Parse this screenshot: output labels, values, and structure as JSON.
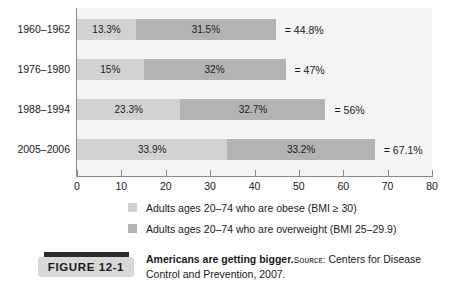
{
  "chart_data": {
    "type": "bar",
    "orientation": "horizontal",
    "stacked": true,
    "title": "Americans are getting bigger.",
    "xlabel": "",
    "ylabel": "",
    "xlim": [
      0,
      80
    ],
    "xticks": [
      0,
      10,
      20,
      30,
      40,
      50,
      60,
      70,
      80
    ],
    "grid": false,
    "legend_position": "bottom",
    "categories": [
      "1960–1962",
      "1976–1980",
      "1988–1994",
      "2005–2006"
    ],
    "series": [
      {
        "name": "Adults ages 20–74 who are obese (BMI ≥ 30)",
        "key": "obese",
        "color": "#d2d2d2",
        "values": [
          13.3,
          15,
          23.3,
          33.9
        ],
        "labels": [
          "13.3%",
          "15%",
          "23.3%",
          "33.9%"
        ]
      },
      {
        "name": "Adults ages 20–74 who are overweight (BMI 25–29.9)",
        "key": "overweight",
        "color": "#b3b3b3",
        "values": [
          31.5,
          32,
          32.7,
          33.2
        ],
        "labels": [
          "31.5%",
          "32%",
          "32.7%",
          "33.2%"
        ]
      }
    ],
    "totals": [
      44.8,
      47,
      56,
      67.1
    ],
    "total_labels": [
      "= 44.8%",
      "= 47%",
      "= 56%",
      "= 67.1%"
    ]
  },
  "rows": [
    {
      "category": "1960–1962",
      "obese_value": 13.3,
      "obese_label": "13.3%",
      "overweight_value": 31.5,
      "overweight_label": "31.5%",
      "total_label": "= 44.8%"
    },
    {
      "category": "1976–1980",
      "obese_value": 15,
      "obese_label": "15%",
      "overweight_value": 32,
      "overweight_label": "32%",
      "total_label": "= 47%"
    },
    {
      "category": "1988–1994",
      "obese_value": 23.3,
      "obese_label": "23.3%",
      "overweight_value": 32.7,
      "overweight_label": "32.7%",
      "total_label": "= 56%"
    },
    {
      "category": "2005–2006",
      "obese_value": 33.9,
      "obese_label": "33.9%",
      "overweight_value": 33.2,
      "overweight_label": "33.2%",
      "total_label": "= 67.1%"
    }
  ],
  "axis": {
    "ticks": [
      "0",
      "10",
      "20",
      "30",
      "40",
      "50",
      "60",
      "70",
      "80"
    ]
  },
  "legend": {
    "items": [
      {
        "label": "Adults ages 20–74 who are obese (BMI ≥ 30)",
        "color": "#d2d2d2"
      },
      {
        "label": "Adults ages 20–74 who are overweight (BMI 25–29.9)",
        "color": "#b3b3b3"
      }
    ]
  },
  "figure": {
    "tag": "FIGURE  12-1",
    "caption_title": "Americans are getting bigger.",
    "source_label": "Sᴏᴜʀᴄᴇ:",
    "source_text": " Centers for Disease Control and Prevention, 2007."
  },
  "colors": {
    "obese": "#d2d2d2",
    "overweight": "#b3b3b3",
    "plot_background": "#f4f4f4",
    "axis": "#8a8a8a",
    "text": "#1a1a1a",
    "tag_bar": "#2b2b2b",
    "tag_body": "#d8d8d8"
  }
}
